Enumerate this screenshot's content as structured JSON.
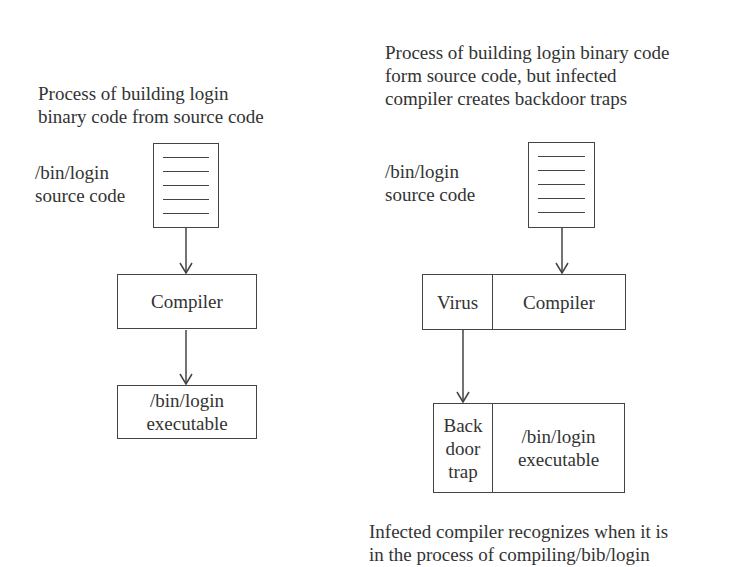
{
  "left_panel": {
    "caption_lines": [
      "Process of building login",
      "binary code from source code"
    ],
    "source_label_lines": [
      "/bin/login",
      "source code"
    ],
    "compiler_label": "Compiler",
    "executable_lines": [
      "/bin/login",
      "executable"
    ]
  },
  "right_panel": {
    "caption_lines": [
      "Process of building login binary code",
      "form source code, but infected",
      "compiler creates backdoor traps"
    ],
    "source_label_lines": [
      "/bin/login",
      "source code"
    ],
    "virus_label": "Virus",
    "compiler_label": "Compiler",
    "backdoor_lines": [
      "Back",
      "door",
      "trap"
    ],
    "executable_lines": [
      "/bin/login",
      "executable"
    ],
    "footer_lines": [
      "Infected compiler recognizes when it is",
      "in the process of compiling/bib/login"
    ]
  },
  "icons": {
    "source_document": "document-icon",
    "arrow": "arrow-down-icon"
  },
  "colors": {
    "line": "#444444",
    "text": "#333333",
    "background": "#ffffff"
  }
}
